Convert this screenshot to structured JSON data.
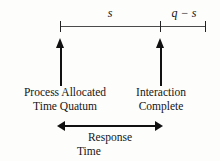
{
  "figure": {
    "background_color": "#fdfdfc",
    "line_color": "#111111"
  },
  "timeline": {
    "segments": [
      {
        "name": "service-segment",
        "label": "s",
        "start_tick": "quantum-start",
        "end_tick": "interaction-complete"
      },
      {
        "name": "remainder-segment",
        "label": "q − s",
        "start_tick": "interaction-complete",
        "end_tick": "quantum-end"
      }
    ],
    "ticks": [
      {
        "name": "quantum-start",
        "x": 60
      },
      {
        "name": "interaction-complete",
        "x": 160
      },
      {
        "name": "quantum-end",
        "x": 205
      }
    ]
  },
  "events": {
    "left": {
      "line1": "Process Allocated",
      "line2": "Time Quatum"
    },
    "right": {
      "line1": "Interaction",
      "line2": "Complete"
    }
  },
  "span": {
    "line1": "Response",
    "line2": "Time",
    "arrow_style": "double-headed"
  }
}
